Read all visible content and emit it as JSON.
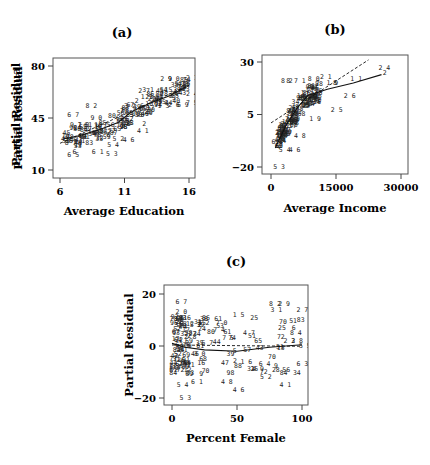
{
  "figure": {
    "panels": [
      {
        "id": "a",
        "label": "(a)"
      },
      {
        "id": "b",
        "label": "(b)"
      },
      {
        "id": "c",
        "label": "(c)"
      }
    ]
  },
  "chart_data": [
    {
      "type": "scatter",
      "title": "(a)",
      "xlabel": "Average Education",
      "ylabel": "Partial Residual",
      "xlim": [
        5.6,
        16.3
      ],
      "ylim": [
        6.5,
        82
      ],
      "xticks": [
        6,
        11,
        16
      ],
      "yticks": [
        10,
        45,
        80
      ],
      "grid": false,
      "point_marker": "text labels (observation numbers)",
      "lines": [
        {
          "name": "least-squares fit",
          "style": "dashed",
          "points": [
            [
              6,
              28
            ],
            [
              16,
              67
            ]
          ]
        },
        {
          "name": "nonparametric smooth",
          "style": "solid",
          "points": [
            [
              6.3,
              31
            ],
            [
              7.5,
              33
            ],
            [
              9,
              37
            ],
            [
              10.5,
              42
            ],
            [
              11.5,
              49
            ],
            [
              13,
              55
            ],
            [
              14.5,
              60
            ],
            [
              15.8,
              66
            ]
          ]
        }
      ],
      "labeled_points": [
        {
          "label": "67",
          "x": 6.8,
          "y": 47
        },
        {
          "label": "82",
          "x": 8.2,
          "y": 53
        },
        {
          "label": "90",
          "x": 8.6,
          "y": 45
        },
        {
          "label": "91",
          "x": 7.0,
          "y": 40
        },
        {
          "label": "70",
          "x": 7.6,
          "y": 40
        },
        {
          "label": "87",
          "x": 6.6,
          "y": 28
        },
        {
          "label": "65",
          "x": 6.8,
          "y": 20
        },
        {
          "label": "6",
          "x": 7.2,
          "y": 22
        },
        {
          "label": "61",
          "x": 8.7,
          "y": 22
        },
        {
          "label": "53",
          "x": 9.8,
          "y": 21
        },
        {
          "label": "54",
          "x": 9.9,
          "y": 27
        },
        {
          "label": "52",
          "x": 10.3,
          "y": 31
        },
        {
          "label": "46",
          "x": 11.1,
          "y": 30
        },
        {
          "label": "41",
          "x": 12.2,
          "y": 36
        },
        {
          "label": "2",
          "x": 12.6,
          "y": 41
        },
        {
          "label": "32",
          "x": 11.2,
          "y": 53
        },
        {
          "label": "27",
          "x": 12.3,
          "y": 63
        },
        {
          "label": "31",
          "x": 12.6,
          "y": 64
        },
        {
          "label": "29",
          "x": 14.0,
          "y": 71
        },
        {
          "label": "90",
          "x": 14.6,
          "y": 71
        },
        {
          "label": "5",
          "x": 15.1,
          "y": 68
        },
        {
          "label": "7",
          "x": 15.4,
          "y": 67
        },
        {
          "label": "8",
          "x": 15.9,
          "y": 68
        },
        {
          "label": "21",
          "x": 16.0,
          "y": 72
        },
        {
          "label": "24",
          "x": 16.0,
          "y": 61
        },
        {
          "label": "75",
          "x": 16.0,
          "y": 55
        },
        {
          "label": "13",
          "x": 13.8,
          "y": 53
        },
        {
          "label": "26",
          "x": 14.6,
          "y": 54
        },
        {
          "label": "69",
          "x": 15.3,
          "y": 54
        },
        {
          "label": "11",
          "x": 12.5,
          "y": 59
        }
      ]
    },
    {
      "type": "scatter",
      "title": "(b)",
      "xlabel": "Average Income",
      "ylabel": "Partial Residual",
      "xlim": [
        -1000,
        31000
      ],
      "ylim": [
        -24,
        34
      ],
      "xticks": [
        0,
        15000,
        30000
      ],
      "yticks": [
        -20,
        5,
        30
      ],
      "grid": false,
      "point_marker": "text labels (observation numbers)",
      "lines": [
        {
          "name": "least-squares fit",
          "style": "dashed",
          "points": [
            [
              0,
              1
            ],
            [
              22500,
              31
            ]
          ]
        },
        {
          "name": "nonparametric smooth",
          "style": "solid",
          "points": [
            [
              1000,
              -11
            ],
            [
              3500,
              0
            ],
            [
              6000,
              8
            ],
            [
              8500,
              14
            ],
            [
              13000,
              17
            ],
            [
              19000,
              20
            ],
            [
              25500,
              24
            ]
          ]
        }
      ],
      "labeled_points": [
        {
          "label": "53",
          "x": 1200,
          "y": -20
        },
        {
          "label": "6",
          "x": 800,
          "y": -8
        },
        {
          "label": "54",
          "x": 2500,
          "y": -12
        },
        {
          "label": "46",
          "x": 4800,
          "y": -12
        },
        {
          "label": "48",
          "x": 6000,
          "y": -5
        },
        {
          "label": "19",
          "x": 9500,
          "y": 3
        },
        {
          "label": "25",
          "x": 14500,
          "y": 7
        },
        {
          "label": "26",
          "x": 17500,
          "y": 14
        },
        {
          "label": "21",
          "x": 12000,
          "y": 23
        },
        {
          "label": "19",
          "x": 13500,
          "y": 20
        },
        {
          "label": "8",
          "x": 15000,
          "y": 20
        },
        {
          "label": "11",
          "x": 19000,
          "y": 22
        },
        {
          "label": "24",
          "x": 25500,
          "y": 27
        },
        {
          "label": "2",
          "x": 26500,
          "y": 25
        },
        {
          "label": "80",
          "x": 9200,
          "y": 22
        },
        {
          "label": "1",
          "x": 7800,
          "y": 21
        },
        {
          "label": "82",
          "x": 3000,
          "y": 21
        },
        {
          "label": "87",
          "x": 4200,
          "y": 21
        }
      ]
    },
    {
      "type": "scatter",
      "title": "(c)",
      "xlabel": "Percent Female",
      "ylabel": "Partial Residual",
      "xlim": [
        -5,
        105
      ],
      "ylim": [
        -23,
        23
      ],
      "xticks": [
        0,
        50,
        100
      ],
      "yticks": [
        -20,
        0,
        20
      ],
      "grid": false,
      "point_marker": "text labels (observation numbers)",
      "lines": [
        {
          "name": "least-squares fit",
          "style": "dashed",
          "points": [
            [
              0,
              0.4
            ],
            [
              100,
              -0.1
            ]
          ]
        },
        {
          "name": "nonparametric smooth",
          "style": "solid",
          "points": [
            [
              0,
              1
            ],
            [
              10,
              -0.5
            ],
            [
              25,
              -1.5
            ],
            [
              50,
              -2
            ],
            [
              75,
              -0.5
            ],
            [
              100,
              0.5
            ]
          ]
        }
      ],
      "labeled_points": [
        {
          "label": "67",
          "x": 5,
          "y": 17
        },
        {
          "label": "20",
          "x": 5,
          "y": 13
        },
        {
          "label": "52",
          "x": 16,
          "y": 8
        },
        {
          "label": "32",
          "x": 22,
          "y": 9
        },
        {
          "label": "70",
          "x": 36,
          "y": 9
        },
        {
          "label": "74",
          "x": 34,
          "y": 6
        },
        {
          "label": "75",
          "x": 41,
          "y": 3
        },
        {
          "label": "57",
          "x": 25,
          "y": 1
        },
        {
          "label": "15",
          "x": 49,
          "y": 12
        },
        {
          "label": "47",
          "x": 57,
          "y": 5
        },
        {
          "label": "82",
          "x": 77,
          "y": 16
        },
        {
          "label": "31",
          "x": 78,
          "y": 14
        },
        {
          "label": "29",
          "x": 84,
          "y": 16
        },
        {
          "label": "27",
          "x": 98,
          "y": 14
        },
        {
          "label": "84",
          "x": 93,
          "y": 5
        },
        {
          "label": "38",
          "x": 94,
          "y": 2
        },
        {
          "label": "22",
          "x": 88,
          "y": 2
        },
        {
          "label": "55",
          "x": 100,
          "y": 0
        },
        {
          "label": "63",
          "x": 98,
          "y": -7
        },
        {
          "label": "16",
          "x": 55,
          "y": -6
        },
        {
          "label": "49",
          "x": 64,
          "y": -9
        },
        {
          "label": "64",
          "x": 69,
          "y": -7
        },
        {
          "label": "52",
          "x": 70,
          "y": -12
        },
        {
          "label": "41",
          "x": 85,
          "y": -15
        },
        {
          "label": "48",
          "x": 40,
          "y": -14
        },
        {
          "label": "46",
          "x": 49,
          "y": -17
        },
        {
          "label": "61",
          "x": 17,
          "y": -14
        },
        {
          "label": "54",
          "x": 6,
          "y": -15
        },
        {
          "label": "53",
          "x": 8,
          "y": -20
        },
        {
          "label": "10",
          "x": 0,
          "y": -8
        },
        {
          "label": "30",
          "x": 19,
          "y": -3
        }
      ]
    }
  ]
}
